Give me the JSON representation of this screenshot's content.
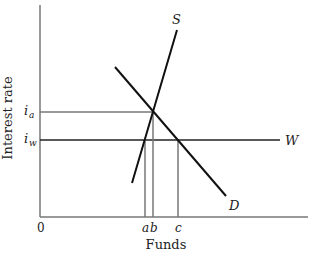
{
  "diagram": {
    "y_axis_label": "Interest rate",
    "x_axis_label": "Funds",
    "origin_label": "0",
    "y_ticks": [
      {
        "base": "i",
        "sub": "a"
      },
      {
        "base": "i",
        "sub": "w"
      }
    ],
    "x_ticks": [
      "a",
      "b",
      "c"
    ],
    "curves": {
      "supply": "S",
      "demand": "D",
      "world_rate": "W"
    }
  }
}
